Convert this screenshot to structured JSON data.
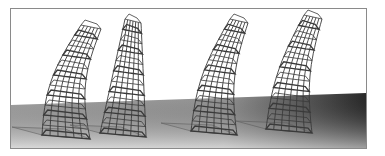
{
  "scene": {
    "description": "Four tapered wireframe towers standing on a gray ground plane, each progressively curved",
    "sky_color": "#ffffff",
    "ground_light": "#b8b8b8",
    "ground_dark": "#2a2a2a",
    "wire_color": "#3a3a3a",
    "towers": [
      {
        "name": "tower-1",
        "lean": "strong-right"
      },
      {
        "name": "tower-2",
        "lean": "straight"
      },
      {
        "name": "tower-3",
        "lean": "right"
      },
      {
        "name": "tower-4",
        "lean": "right"
      }
    ]
  }
}
